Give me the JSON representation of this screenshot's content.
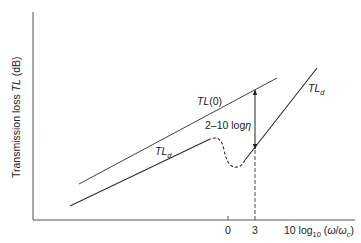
{
  "figure": {
    "y_axis_label_prefix": "Transmission loss ",
    "y_axis_label_symbol": "TL",
    "y_axis_label_suffix": " (dB)",
    "x_axis_label_prefix": "10 log",
    "x_axis_label_subscript": "10",
    "x_axis_label_arg_open": " (",
    "x_axis_label_omega": "ω",
    "x_axis_label_slash": "/",
    "x_axis_label_omega_c": "ω",
    "x_axis_label_omega_c_sub": "c",
    "x_axis_label_arg_close": ")",
    "x_ticks": [
      "0",
      "3"
    ],
    "curves": {
      "tl0": {
        "label": "TL",
        "label_arg": "(0)"
      },
      "tld_lower": {
        "label": "TL",
        "label_sub": "d"
      },
      "tld_upper": {
        "label": "TL",
        "label_sub": "d"
      }
    },
    "annotation": {
      "text_prefix": "2–10 log",
      "text_symbol": "η"
    },
    "colors": {
      "line": "#2a2a2a",
      "axis": "#555555",
      "text": "#222222"
    }
  }
}
